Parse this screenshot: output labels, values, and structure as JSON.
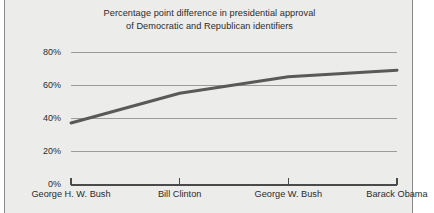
{
  "figure": {
    "background_color": "#ffffff",
    "panel_color": "#ececeb",
    "border_color": "#8a8a8a",
    "gridline_color": "#9b9b9b",
    "axis_color": "#4a4a4a",
    "line_color": "#595959"
  },
  "chart_data": {
    "type": "line",
    "title": "Percentage point difference in presidential approval of Democratic and Republican identifiers",
    "title_lines": [
      "Percentage point difference in presidential approval",
      "of Democratic and Republican identifiers"
    ],
    "xlabel": "",
    "ylabel": "",
    "categories": [
      "George H. W. Bush",
      "Bill Clinton",
      "George W. Bush",
      "Barack Obama"
    ],
    "values": [
      37,
      55,
      65,
      69
    ],
    "series": [
      {
        "name": "Percentage point difference",
        "values": [
          37,
          55,
          65,
          69
        ],
        "color": "#595959"
      }
    ],
    "ylim": [
      0,
      80
    ],
    "ytick_values": [
      80,
      60,
      40,
      20,
      0
    ],
    "ytick_labels": [
      "80%",
      "60%",
      "40%",
      "20%",
      "0%"
    ],
    "xtick_labels": [
      "George H. W. Bush",
      "Bill Clinton",
      "George W. Bush",
      "Barack Obama"
    ],
    "grid": true,
    "grid_axis": "y",
    "legend": false,
    "legend_position": "none",
    "line_width_px": 3,
    "annotations": []
  }
}
